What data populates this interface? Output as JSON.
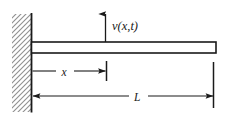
{
  "figure": {
    "caption": "",
    "colors": {
      "line": "#1a1a1a",
      "thin_line": "#3a3a3a",
      "hatch": "#8a8a8a",
      "wall_fill": "#ffffff",
      "beam_fill": "#ffffff",
      "background": "#ffffff"
    },
    "labels": {
      "deflection": "v(x,t)",
      "deflection_variable": "v",
      "deflection_args": "(x,t)",
      "position": "x",
      "length": "L"
    },
    "geometry": {
      "wall_left": 12,
      "wall_right": 31,
      "wall_top": 14,
      "wall_bottom": 112,
      "beam_left": 31,
      "beam_right": 216,
      "beam_top": 42,
      "beam_bottom": 53,
      "arrow_x": 105,
      "arrow_tip_y": 12,
      "arrow_base_y": 42,
      "x_dim_y": 71,
      "x_dim_end": 106,
      "l_dim_y": 96,
      "l_dim_end": 213,
      "extension_top": 62
    },
    "annotations": [
      {
        "name": "deflection-arrow",
        "meaning": "upward transverse deflection v(x,t) at station x"
      },
      {
        "name": "x-dimension",
        "meaning": "distance x measured from fixed end"
      },
      {
        "name": "l-dimension",
        "meaning": "total beam length L"
      },
      {
        "name": "fixed-support",
        "meaning": "clamped (built-in) wall support, hatched"
      }
    ]
  }
}
